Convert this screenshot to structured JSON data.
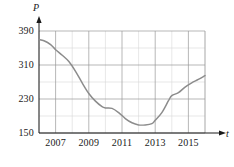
{
  "chart_data": {
    "type": "line",
    "title": "",
    "xlabel": "t",
    "ylabel": "P",
    "xlim": [
      2006,
      2016
    ],
    "ylim": [
      150,
      390
    ],
    "yticks": [
      150,
      230,
      310,
      390
    ],
    "xticks": [
      2007,
      2009,
      2011,
      2013,
      2015
    ],
    "grid": true,
    "grid_minor_x_step": 1,
    "grid_minor_y_step": 40,
    "legend": "none",
    "series": [
      {
        "name": "P",
        "color": "#8c8c8c",
        "x": [
          2006.0,
          2006.3,
          2006.7,
          2007.0,
          2007.4,
          2007.8,
          2008.2,
          2008.6,
          2009.0,
          2009.4,
          2009.8,
          2010.0,
          2010.4,
          2010.8,
          2011.2,
          2011.6,
          2012.0,
          2012.4,
          2012.8,
          2013.0,
          2013.4,
          2013.8,
          2014.0,
          2014.4,
          2014.8,
          2015.2,
          2015.6,
          2016.0
        ],
        "y": [
          370,
          367,
          358,
          346,
          333,
          318,
          295,
          268,
          243,
          225,
          212,
          209,
          208,
          198,
          184,
          174,
          169,
          169,
          172,
          180,
          198,
          226,
          238,
          245,
          258,
          268,
          276,
          285
        ]
      }
    ]
  },
  "axis": {
    "y_name": "P",
    "x_name": "t"
  }
}
